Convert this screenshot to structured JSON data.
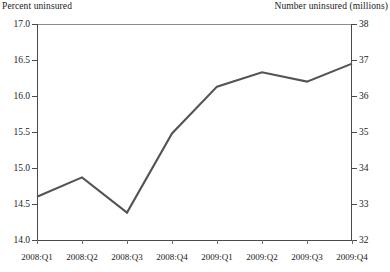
{
  "chart_data": {
    "type": "line",
    "title": "",
    "categories": [
      "2008:Q1",
      "2008:Q2",
      "2008:Q3",
      "2008:Q4",
      "2009:Q1",
      "2009:Q2",
      "2009:Q3",
      "2009:Q4"
    ],
    "series": [
      {
        "name": "Percent uninsured",
        "values": [
          14.6,
          14.87,
          14.38,
          15.48,
          16.13,
          16.33,
          16.2,
          16.45
        ],
        "color": "#545454"
      }
    ],
    "left_axis": {
      "label": "Percent uninsured",
      "ticks": [
        "17.0",
        "16.5",
        "16.0",
        "15.5",
        "15.0",
        "14.5",
        "14.0"
      ],
      "tick_values": [
        17.0,
        16.5,
        16.0,
        15.5,
        15.0,
        14.5,
        14.0
      ],
      "ylim": [
        14.0,
        17.0
      ]
    },
    "right_axis": {
      "label": "Number uninsured (millions)",
      "ticks": [
        "38",
        "37",
        "36",
        "35",
        "34",
        "33",
        "32"
      ],
      "tick_values": [
        38,
        37,
        36,
        35,
        34,
        33,
        32
      ],
      "ylim": [
        32,
        38
      ]
    },
    "xlabel": "",
    "grid": false,
    "legend": "none"
  },
  "axis_titles": {
    "left": "Percent uninsured",
    "right": "Number uninsured (millions)"
  }
}
